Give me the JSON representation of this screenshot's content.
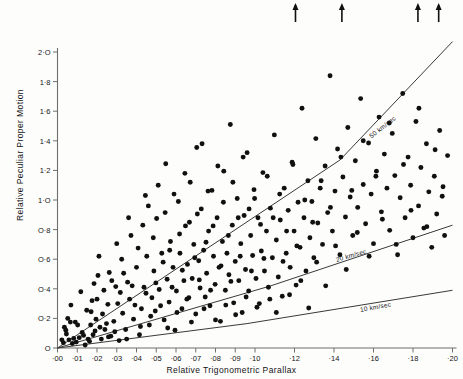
{
  "figure": {
    "background": "#fdfdfc",
    "point_color": "#101010",
    "line_color": "#3a3a3a",
    "axis_color": "#6f6f6f"
  },
  "chart_data": {
    "type": "scatter",
    "title": "",
    "xlabel": "Relative Trigonometric Parallax",
    "ylabel": "Relative Peculiar Proper Motion",
    "xlim": [
      0.0,
      0.2
    ],
    "ylim": [
      0.0,
      2.0
    ],
    "grid": false,
    "legend": "none",
    "xticks": [
      0.0,
      0.01,
      0.02,
      0.03,
      0.04,
      0.05,
      0.06,
      0.07,
      0.08,
      0.09,
      0.1,
      0.12,
      0.14,
      0.16,
      0.18,
      0.2
    ],
    "xticklabels": [
      "·00",
      "·01",
      "·02",
      "·03",
      "·04",
      "·05",
      "·06",
      "·07",
      "·08",
      "·09",
      "·10",
      "·12",
      "·14",
      "·16",
      "·18",
      "·20"
    ],
    "yticks": [
      0.0,
      0.2,
      0.4,
      0.6,
      0.8,
      1.0,
      1.2,
      1.4,
      1.6,
      1.8,
      2.0
    ],
    "yticklabels": [
      "O",
      "O·2",
      "O·4",
      "O·6",
      "O·8",
      "1·O",
      "1·2",
      "1·4",
      "1·6",
      "1·8",
      "2·O"
    ],
    "annotations": [
      {
        "text": "50 km/sec",
        "x": 0.158,
        "y": 1.45,
        "rotation": -38
      },
      {
        "text": "20 km/sec",
        "x": 0.141,
        "y": 0.62,
        "rotation": -16
      },
      {
        "text": "10 km/sec",
        "x": 0.153,
        "y": 0.285,
        "rotation": -10
      }
    ],
    "curves": [
      {
        "name": "50 km/sec",
        "points": [
          [
            0.0,
            0.0
          ],
          [
            0.143,
            1.27
          ],
          [
            0.2,
            2.07
          ]
        ]
      },
      {
        "name": "20 km/sec",
        "points": [
          [
            0.0,
            0.0
          ],
          [
            0.108,
            0.42
          ],
          [
            0.2,
            0.83
          ]
        ]
      },
      {
        "name": "10 km/sec",
        "points": [
          [
            0.0,
            0.0
          ],
          [
            0.096,
            0.165
          ],
          [
            0.2,
            0.39
          ]
        ]
      }
    ],
    "top_arrows": [
      {
        "x": 0.1205,
        "label": "off-scale-marker"
      },
      {
        "x": 0.144,
        "label": "off-scale-marker"
      },
      {
        "x": 0.1825,
        "label": "off-scale-marker"
      },
      {
        "x": 0.193,
        "label": "off-scale-marker"
      }
    ],
    "points": [
      [
        0.0065,
        0.175
      ],
      [
        0.009,
        0.175
      ],
      [
        0.017,
        0.245
      ],
      [
        0.0185,
        0.435
      ],
      [
        0.0035,
        0.14
      ],
      [
        0.0045,
        0.095
      ],
      [
        0.0058,
        0.055
      ],
      [
        0.0075,
        0.03
      ],
      [
        0.0095,
        0.04
      ],
      [
        0.011,
        0.07
      ],
      [
        0.0125,
        0.105
      ],
      [
        0.014,
        0.02
      ],
      [
        0.0155,
        0.06
      ],
      [
        0.0168,
        0.155
      ],
      [
        0.018,
        0.09
      ],
      [
        0.0195,
        0.195
      ],
      [
        0.02,
        0.33
      ],
      [
        0.0205,
        0.49
      ],
      [
        0.0215,
        0.14
      ],
      [
        0.0228,
        0.23
      ],
      [
        0.024,
        0.125
      ],
      [
        0.0255,
        0.295
      ],
      [
        0.0262,
        0.51
      ],
      [
        0.027,
        0.08
      ],
      [
        0.0285,
        0.18
      ],
      [
        0.0295,
        0.415
      ],
      [
        0.0305,
        0.3
      ],
      [
        0.0312,
        0.05
      ],
      [
        0.0325,
        0.6
      ],
      [
        0.033,
        0.235
      ],
      [
        0.0345,
        0.125
      ],
      [
        0.0355,
        0.445
      ],
      [
        0.0365,
        0.33
      ],
      [
        0.0372,
        0.76
      ],
      [
        0.0385,
        0.195
      ],
      [
        0.04,
        0.545
      ],
      [
        0.0415,
        0.09
      ],
      [
        0.0425,
        0.265
      ],
      [
        0.0438,
        0.41
      ],
      [
        0.0445,
        1.03
      ],
      [
        0.0452,
        0.62
      ],
      [
        0.0465,
        0.155
      ],
      [
        0.0478,
        0.34
      ],
      [
        0.0488,
        0.52
      ],
      [
        0.0495,
        0.25
      ],
      [
        0.0502,
        0.875
      ],
      [
        0.0515,
        0.395
      ],
      [
        0.0528,
        0.64
      ],
      [
        0.054,
        0.19
      ],
      [
        0.0548,
        1.245
      ],
      [
        0.0555,
        0.465
      ],
      [
        0.0565,
        0.31
      ],
      [
        0.0572,
        0.72
      ],
      [
        0.0585,
        0.545
      ],
      [
        0.0595,
        0.12
      ],
      [
        0.0602,
        0.385
      ],
      [
        0.0612,
        0.99
      ],
      [
        0.062,
        0.64
      ],
      [
        0.063,
        0.265
      ],
      [
        0.064,
        0.455
      ],
      [
        0.0648,
        0.825
      ],
      [
        0.0658,
        0.565
      ],
      [
        0.0665,
        0.34
      ],
      [
        0.0672,
        1.12
      ],
      [
        0.0682,
        0.47
      ],
      [
        0.069,
        0.7
      ],
      [
        0.07,
        0.23
      ],
      [
        0.0708,
        0.905
      ],
      [
        0.0715,
        0.59
      ],
      [
        0.0722,
        0.405
      ],
      [
        0.0732,
        1.38
      ],
      [
        0.074,
        0.66
      ],
      [
        0.0748,
        0.345
      ],
      [
        0.0755,
        0.505
      ],
      [
        0.0765,
        0.79
      ],
      [
        0.0772,
        0.285
      ],
      [
        0.0782,
        1.065
      ],
      [
        0.079,
        0.62
      ],
      [
        0.0798,
        0.43
      ],
      [
        0.0808,
        0.88
      ],
      [
        0.0818,
        0.545
      ],
      [
        0.0825,
        0.18
      ],
      [
        0.0835,
        0.72
      ],
      [
        0.0842,
        1.195
      ],
      [
        0.085,
        0.39
      ],
      [
        0.0858,
        0.64
      ],
      [
        0.0868,
        0.495
      ],
      [
        0.0875,
        1.51
      ],
      [
        0.0885,
        0.83
      ],
      [
        0.0892,
        0.305
      ],
      [
        0.09,
        0.585
      ],
      [
        0.091,
        1.01
      ],
      [
        0.0918,
        0.455
      ],
      [
        0.0928,
        0.705
      ],
      [
        0.0935,
        0.24
      ],
      [
        0.0945,
        0.895
      ],
      [
        0.0952,
        0.53
      ],
      [
        0.096,
        1.32
      ],
      [
        0.0968,
        0.385
      ],
      [
        0.0978,
        0.76
      ],
      [
        0.0988,
        0.625
      ],
      [
        0.0995,
        1.07
      ],
      [
        0.1005,
        0.47
      ],
      [
        0.1015,
        0.88
      ],
      [
        0.1022,
        0.3
      ],
      [
        0.1032,
        0.655
      ],
      [
        0.104,
        1.185
      ],
      [
        0.1048,
        0.52
      ],
      [
        0.1058,
        0.79
      ],
      [
        0.1068,
        0.41
      ],
      [
        0.1078,
        0.945
      ],
      [
        0.1088,
        0.61
      ],
      [
        0.1098,
        1.44
      ],
      [
        0.1108,
        0.73
      ],
      [
        0.1118,
        0.48
      ],
      [
        0.1128,
        0.865
      ],
      [
        0.1138,
        0.35
      ],
      [
        0.1148,
        1.08
      ],
      [
        0.1158,
        0.64
      ],
      [
        0.1168,
        0.93
      ],
      [
        0.1178,
        0.545
      ],
      [
        0.1188,
        1.255
      ],
      [
        0.1198,
        0.79
      ],
      [
        0.1208,
        0.425
      ],
      [
        0.1218,
        0.985
      ],
      [
        0.1228,
        0.68
      ],
      [
        0.1238,
        1.62
      ],
      [
        0.1248,
        0.88
      ],
      [
        0.1258,
        0.52
      ],
      [
        0.1268,
        1.13
      ],
      [
        0.1278,
        0.745
      ],
      [
        0.1288,
        0.99
      ],
      [
        0.1298,
        0.61
      ],
      [
        0.1308,
        1.415
      ],
      [
        0.1318,
        0.845
      ],
      [
        0.133,
        1.08
      ],
      [
        0.1342,
        0.7
      ],
      [
        0.1355,
        1.23
      ],
      [
        0.1368,
        0.915
      ],
      [
        0.138,
        1.84
      ],
      [
        0.1392,
        0.79
      ],
      [
        0.1405,
        1.06
      ],
      [
        0.1418,
        1.345
      ],
      [
        0.143,
        0.63
      ],
      [
        0.1445,
        1.155
      ],
      [
        0.1458,
        0.885
      ],
      [
        0.147,
        1.49
      ],
      [
        0.1482,
        1.02
      ],
      [
        0.1495,
        0.76
      ],
      [
        0.1508,
        1.265
      ],
      [
        0.152,
        0.95
      ],
      [
        0.1535,
        1.685
      ],
      [
        0.1548,
        1.105
      ],
      [
        0.156,
        0.84
      ],
      [
        0.1575,
        1.385
      ],
      [
        0.1588,
        1.04
      ],
      [
        0.16,
        0.705
      ],
      [
        0.1615,
        1.195
      ],
      [
        0.1628,
        1.56
      ],
      [
        0.164,
        0.92
      ],
      [
        0.1655,
        1.31
      ],
      [
        0.1668,
        1.08
      ],
      [
        0.1682,
        0.795
      ],
      [
        0.1695,
        1.45
      ],
      [
        0.1708,
        1.165
      ],
      [
        0.1722,
        0.63
      ],
      [
        0.1735,
        1.015
      ],
      [
        0.1748,
        1.72
      ],
      [
        0.176,
        0.88
      ],
      [
        0.1775,
        1.29
      ],
      [
        0.1788,
        1.1
      ],
      [
        0.18,
        0.745
      ],
      [
        0.1815,
        1.53
      ],
      [
        0.1828,
        0.96
      ],
      [
        0.184,
        1.22
      ],
      [
        0.1855,
        0.81
      ],
      [
        0.1868,
        1.38
      ],
      [
        0.188,
        1.055
      ],
      [
        0.1895,
        0.68
      ],
      [
        0.1908,
        1.16
      ],
      [
        0.192,
        0.905
      ],
      [
        0.1935,
        1.47
      ],
      [
        0.1948,
        1.025
      ],
      [
        0.196,
        0.76
      ],
      [
        0.1975,
        1.3
      ],
      [
        0.0022,
        0.055
      ],
      [
        0.003,
        0.035
      ],
      [
        0.0042,
        0.12
      ],
      [
        0.0052,
        0.2
      ],
      [
        0.0068,
        0.29
      ],
      [
        0.0082,
        0.065
      ],
      [
        0.0102,
        0.155
      ],
      [
        0.0118,
        0.38
      ],
      [
        0.0132,
        0.085
      ],
      [
        0.0148,
        0.255
      ],
      [
        0.0162,
        0.045
      ],
      [
        0.0175,
        0.32
      ],
      [
        0.019,
        0.115
      ],
      [
        0.021,
        0.62
      ],
      [
        0.0222,
        0.06
      ],
      [
        0.0235,
        0.39
      ],
      [
        0.0248,
        0.165
      ],
      [
        0.0258,
        0.075
      ],
      [
        0.0275,
        0.455
      ],
      [
        0.029,
        0.11
      ],
      [
        0.03,
        0.705
      ],
      [
        0.0318,
        0.375
      ],
      [
        0.0335,
        0.505
      ],
      [
        0.035,
        0.06
      ],
      [
        0.036,
        0.88
      ],
      [
        0.0378,
        0.42
      ],
      [
        0.0392,
        0.29
      ],
      [
        0.0408,
        0.675
      ],
      [
        0.042,
        0.145
      ],
      [
        0.0432,
        0.83
      ],
      [
        0.0448,
        0.37
      ],
      [
        0.046,
        0.96
      ],
      [
        0.0472,
        0.215
      ],
      [
        0.0485,
        0.745
      ],
      [
        0.0498,
        0.44
      ],
      [
        0.051,
        1.1
      ],
      [
        0.0522,
        0.285
      ],
      [
        0.0535,
        0.58
      ],
      [
        0.0545,
        0.915
      ],
      [
        0.0558,
        0.135
      ],
      [
        0.0568,
        0.66
      ],
      [
        0.058,
        0.41
      ],
      [
        0.059,
        1.04
      ],
      [
        0.0605,
        0.24
      ],
      [
        0.0618,
        0.77
      ],
      [
        0.0632,
        0.525
      ],
      [
        0.0645,
        1.18
      ],
      [
        0.0655,
        0.33
      ],
      [
        0.0668,
        0.85
      ],
      [
        0.0678,
        0.175
      ],
      [
        0.0695,
        0.61
      ],
      [
        0.0705,
        1.355
      ],
      [
        0.0718,
        0.46
      ],
      [
        0.0728,
        0.94
      ],
      [
        0.0742,
        0.265
      ],
      [
        0.0752,
        0.715
      ],
      [
        0.0762,
        1.06
      ],
      [
        0.0775,
        0.39
      ],
      [
        0.0788,
        0.825
      ],
      [
        0.08,
        0.19
      ],
      [
        0.0812,
        1.23
      ],
      [
        0.0828,
        0.555
      ],
      [
        0.084,
        0.985
      ],
      [
        0.0852,
        0.29
      ],
      [
        0.0865,
        0.76
      ],
      [
        0.0878,
        0.45
      ],
      [
        0.0888,
        1.12
      ],
      [
        0.0902,
        0.225
      ],
      [
        0.0915,
        0.88
      ],
      [
        0.0925,
        0.62
      ],
      [
        0.094,
        1.29
      ],
      [
        0.0955,
        0.345
      ],
      [
        0.097,
        0.94
      ],
      [
        0.0982,
        0.52
      ],
      [
        0.0998,
        1.01
      ],
      [
        0.101,
        0.275
      ],
      [
        0.1028,
        0.835
      ],
      [
        0.1045,
        0.605
      ],
      [
        0.1062,
        1.16
      ],
      [
        0.1075,
        0.33
      ],
      [
        0.1092,
        0.88
      ],
      [
        0.1108,
        0.24
      ],
      [
        0.1125,
        1.04
      ],
      [
        0.1142,
        0.585
      ],
      [
        0.116,
        0.79
      ],
      [
        0.1175,
        0.36
      ],
      [
        0.1192,
        1.24
      ],
      [
        0.1212,
        0.69
      ],
      [
        0.1232,
        0.455
      ],
      [
        0.1252,
        1.0
      ],
      [
        0.1272,
        0.27
      ],
      [
        0.1292,
        0.85
      ],
      [
        0.1312,
        0.58
      ],
      [
        0.1335,
        1.13
      ],
      [
        0.1358,
        0.42
      ],
      [
        0.1382,
        0.95
      ],
      [
        0.1408,
        0.69
      ],
      [
        0.1435,
        1.29
      ],
      [
        0.1462,
        0.53
      ],
      [
        0.149,
        1.065
      ],
      [
        0.1518,
        0.78
      ],
      [
        0.1548,
        1.4
      ],
      [
        0.1578,
        0.62
      ],
      [
        0.1612,
        1.16
      ],
      [
        0.1645,
        0.87
      ],
      [
        0.168,
        1.52
      ],
      [
        0.1715,
        0.7
      ],
      [
        0.1752,
        1.24
      ],
      [
        0.179,
        0.93
      ],
      [
        0.183,
        1.62
      ],
      [
        0.187,
        0.82
      ],
      [
        0.1912,
        1.34
      ],
      [
        0.1952,
        1.09
      ]
    ]
  }
}
